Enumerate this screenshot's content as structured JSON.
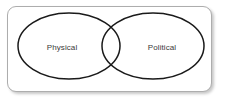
{
  "canvas": {
    "width": 225,
    "height": 102,
    "background_color": "#ffffff"
  },
  "panel": {
    "border_color": "#adadad",
    "fill_color": "#ffffff",
    "corner_radius_px": 9,
    "has_drop_shadow": true
  },
  "diagram": {
    "type": "venn",
    "set_count": 2,
    "stroke_color": "#1a1a1a",
    "stroke_width_px": 1.5,
    "fill": "none",
    "overlap": "intersecting",
    "sets": [
      {
        "id": "left",
        "label": "Physical",
        "center_x": 69,
        "center_y": 46,
        "radius_x": 51,
        "radius_y": 33
      },
      {
        "id": "right",
        "label": "Political",
        "center_x": 153,
        "center_y": 46,
        "radius_x": 51,
        "radius_y": 33
      }
    ],
    "label_color": "#3a3a3a"
  }
}
